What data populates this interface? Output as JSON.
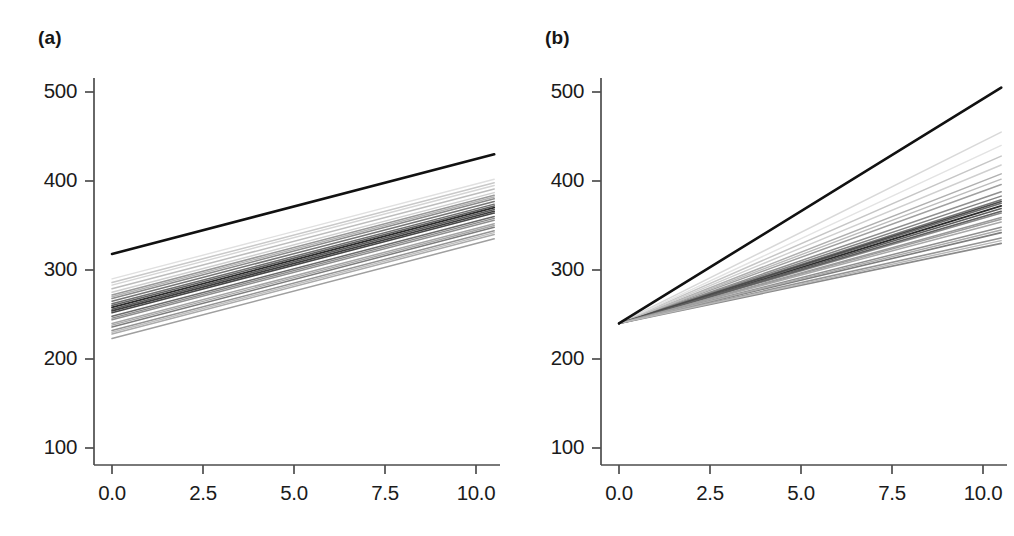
{
  "figure": {
    "background": "#ffffff",
    "width": 1014,
    "height": 536
  },
  "panels": [
    {
      "id": "a",
      "label": "(a)"
    },
    {
      "id": "b",
      "label": "(b)"
    }
  ],
  "axis": {
    "y_ticks": [
      "500",
      "400",
      "300",
      "200",
      "100"
    ],
    "x_ticks": [
      "0.0",
      "2.5",
      "5.0",
      "7.5",
      "10.0"
    ],
    "axis_color": "#4d4d4d",
    "population_line_color": "#111111",
    "group_line_color": "#808080"
  },
  "chart_data": [
    {
      "type": "line",
      "panel": "a",
      "title": "(a)",
      "subtitle": "",
      "xlabel": "",
      "ylabel": "",
      "xlim": [
        -0.55,
        10.55
      ],
      "ylim": [
        55,
        545
      ],
      "xticks": [
        0.0,
        2.5,
        5.0,
        7.5,
        10.0
      ],
      "yticks": [
        100,
        200,
        300,
        400,
        500
      ],
      "grid": false,
      "legend": "none",
      "description": "Random-intercept model: parallel subject lines with a common slope and varying intercepts; bold black line is the population average.",
      "x": [
        0,
        10.5
      ],
      "series": [
        {
          "name": "population-average",
          "emphasis": "bold",
          "color": "#111111",
          "width": 2.6,
          "values": [
            318,
            430
          ]
        },
        {
          "name": "group-01",
          "emphasis": "normal",
          "color": "#2b2b2b",
          "width": 1.8,
          "values": [
            258,
            370
          ]
        },
        {
          "name": "group-02",
          "emphasis": "normal",
          "color": "#6f6f6f",
          "width": 1.5,
          "values": [
            262,
            374
          ]
        },
        {
          "name": "group-03",
          "emphasis": "normal",
          "color": "#8a8a8a",
          "width": 1.5,
          "values": [
            268,
            380
          ]
        },
        {
          "name": "group-04",
          "emphasis": "normal",
          "color": "#c9c9c9",
          "width": 1.5,
          "values": [
            286,
            398
          ]
        },
        {
          "name": "group-05",
          "emphasis": "normal",
          "color": "#bdbdbd",
          "width": 1.5,
          "values": [
            279,
            391
          ]
        },
        {
          "name": "group-06",
          "emphasis": "normal",
          "color": "#9a9a9a",
          "width": 1.5,
          "values": [
            272,
            384
          ]
        },
        {
          "name": "group-07",
          "emphasis": "normal",
          "color": "#767676",
          "width": 1.5,
          "values": [
            265,
            377
          ]
        },
        {
          "name": "group-08",
          "emphasis": "normal",
          "color": "#5a5a5a",
          "width": 1.6,
          "values": [
            256,
            368
          ]
        },
        {
          "name": "group-09",
          "emphasis": "normal",
          "color": "#474747",
          "width": 1.6,
          "values": [
            252,
            364
          ]
        },
        {
          "name": "group-10",
          "emphasis": "normal",
          "color": "#6b6b6b",
          "width": 1.5,
          "values": [
            248,
            360
          ]
        },
        {
          "name": "group-11",
          "emphasis": "normal",
          "color": "#8f8f8f",
          "width": 1.5,
          "values": [
            244,
            356
          ]
        },
        {
          "name": "group-12",
          "emphasis": "normal",
          "color": "#a5a5a5",
          "width": 1.5,
          "values": [
            240,
            352
          ]
        },
        {
          "name": "group-13",
          "emphasis": "normal",
          "color": "#7d7d7d",
          "width": 1.5,
          "values": [
            236,
            348
          ]
        },
        {
          "name": "group-14",
          "emphasis": "normal",
          "color": "#949494",
          "width": 1.5,
          "values": [
            232,
            344
          ]
        },
        {
          "name": "group-15",
          "emphasis": "normal",
          "color": "#ababab",
          "width": 1.5,
          "values": [
            228,
            340
          ]
        },
        {
          "name": "group-16",
          "emphasis": "normal",
          "color": "#9f9f9f",
          "width": 1.5,
          "values": [
            223,
            335
          ]
        },
        {
          "name": "group-17",
          "emphasis": "normal",
          "color": "#d5d5d5",
          "width": 1.4,
          "values": [
            283,
            395
          ]
        },
        {
          "name": "group-18",
          "emphasis": "normal",
          "color": "#e0e0e0",
          "width": 1.4,
          "values": [
            290,
            402
          ]
        },
        {
          "name": "group-19",
          "emphasis": "normal",
          "color": "#cfcfcf",
          "width": 1.4,
          "values": [
            275,
            387
          ]
        },
        {
          "name": "group-20",
          "emphasis": "normal",
          "color": "#b3b3b3",
          "width": 1.4,
          "values": [
            270,
            382
          ]
        },
        {
          "name": "group-21",
          "emphasis": "normal",
          "color": "#616161",
          "width": 1.6,
          "values": [
            260,
            372
          ]
        },
        {
          "name": "group-22",
          "emphasis": "normal",
          "color": "#3d3d3d",
          "width": 1.7,
          "values": [
            254,
            366
          ]
        },
        {
          "name": "group-23",
          "emphasis": "normal",
          "color": "#8c8c8c",
          "width": 1.4,
          "values": [
            246,
            358
          ]
        },
        {
          "name": "group-24",
          "emphasis": "normal",
          "color": "#a8a8a8",
          "width": 1.4,
          "values": [
            238,
            350
          ]
        },
        {
          "name": "group-25",
          "emphasis": "normal",
          "color": "#bfbfbf",
          "width": 1.4,
          "values": [
            230,
            342
          ]
        }
      ]
    },
    {
      "type": "line",
      "panel": "b",
      "title": "(b)",
      "subtitle": "",
      "xlabel": "",
      "ylabel": "",
      "xlim": [
        -0.55,
        10.55
      ],
      "ylim": [
        55,
        545
      ],
      "xticks": [
        0.0,
        2.5,
        5.0,
        7.5,
        10.0
      ],
      "yticks": [
        100,
        200,
        300,
        400,
        500
      ],
      "grid": false,
      "legend": "none",
      "description": "Random-slope model: subject lines fan out from a shared intercept near 240 with varying slopes; bold black line is the population average.",
      "x": [
        0,
        10.5
      ],
      "series": [
        {
          "name": "population-average",
          "emphasis": "bold",
          "color": "#111111",
          "width": 2.6,
          "values": [
            240,
            505
          ]
        },
        {
          "name": "group-01",
          "emphasis": "normal",
          "color": "#2b2b2b",
          "width": 1.9,
          "values": [
            240,
            372
          ]
        },
        {
          "name": "group-02",
          "emphasis": "normal",
          "color": "#d8d8d8",
          "width": 1.5,
          "values": [
            240,
            455
          ]
        },
        {
          "name": "group-03",
          "emphasis": "normal",
          "color": "#c6c6c6",
          "width": 1.5,
          "values": [
            240,
            428
          ]
        },
        {
          "name": "group-04",
          "emphasis": "normal",
          "color": "#b0b0b0",
          "width": 1.5,
          "values": [
            240,
            408
          ]
        },
        {
          "name": "group-05",
          "emphasis": "normal",
          "color": "#a0a0a0",
          "width": 1.5,
          "values": [
            240,
            396
          ]
        },
        {
          "name": "group-06",
          "emphasis": "normal",
          "color": "#909090",
          "width": 1.5,
          "values": [
            240,
            388
          ]
        },
        {
          "name": "group-07",
          "emphasis": "normal",
          "color": "#858585",
          "width": 1.5,
          "values": [
            240,
            383
          ]
        },
        {
          "name": "group-08",
          "emphasis": "normal",
          "color": "#777777",
          "width": 1.5,
          "values": [
            240,
            379
          ]
        },
        {
          "name": "group-09",
          "emphasis": "normal",
          "color": "#6a6a6a",
          "width": 1.5,
          "values": [
            240,
            375
          ]
        },
        {
          "name": "group-10",
          "emphasis": "normal",
          "color": "#5e5e5e",
          "width": 1.5,
          "values": [
            240,
            369
          ]
        },
        {
          "name": "group-11",
          "emphasis": "normal",
          "color": "#8b8b8b",
          "width": 1.5,
          "values": [
            240,
            364
          ]
        },
        {
          "name": "group-12",
          "emphasis": "normal",
          "color": "#999999",
          "width": 1.5,
          "values": [
            240,
            359
          ]
        },
        {
          "name": "group-13",
          "emphasis": "normal",
          "color": "#a8a8a8",
          "width": 1.5,
          "values": [
            240,
            354
          ]
        },
        {
          "name": "group-14",
          "emphasis": "normal",
          "color": "#8f8f8f",
          "width": 1.5,
          "values": [
            240,
            348
          ]
        },
        {
          "name": "group-15",
          "emphasis": "normal",
          "color": "#7e7e7e",
          "width": 1.6,
          "values": [
            240,
            342
          ]
        },
        {
          "name": "group-16",
          "emphasis": "normal",
          "color": "#949494",
          "width": 1.6,
          "values": [
            240,
            336
          ]
        },
        {
          "name": "group-17",
          "emphasis": "normal",
          "color": "#8a8a8a",
          "width": 1.7,
          "values": [
            240,
            330
          ]
        },
        {
          "name": "group-18",
          "emphasis": "normal",
          "color": "#e3e3e3",
          "width": 1.4,
          "values": [
            240,
            440
          ]
        },
        {
          "name": "group-19",
          "emphasis": "normal",
          "color": "#cfcfcf",
          "width": 1.4,
          "values": [
            240,
            418
          ]
        },
        {
          "name": "group-20",
          "emphasis": "normal",
          "color": "#bbbbbb",
          "width": 1.4,
          "values": [
            240,
            402
          ]
        },
        {
          "name": "group-21",
          "emphasis": "normal",
          "color": "#4c4c4c",
          "width": 1.6,
          "values": [
            240,
            377
          ]
        },
        {
          "name": "group-22",
          "emphasis": "normal",
          "color": "#606060",
          "width": 1.6,
          "values": [
            240,
            366
          ]
        },
        {
          "name": "group-23",
          "emphasis": "normal",
          "color": "#9e9e9e",
          "width": 1.4,
          "values": [
            240,
            357
          ]
        },
        {
          "name": "group-24",
          "emphasis": "normal",
          "color": "#ababab",
          "width": 1.4,
          "values": [
            240,
            345
          ]
        },
        {
          "name": "group-25",
          "emphasis": "normal",
          "color": "#b8b8b8",
          "width": 1.4,
          "values": [
            240,
            333
          ]
        }
      ]
    }
  ]
}
